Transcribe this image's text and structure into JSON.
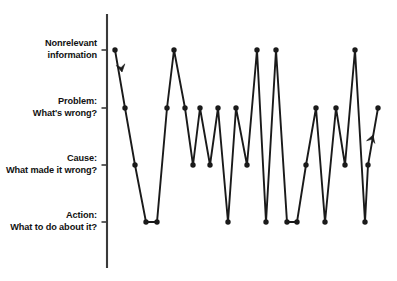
{
  "figure": {
    "background_color": "#ffffff",
    "line_color": "#1a1a1a",
    "marker_color": "#1a1a1a",
    "axis_color": "#3a3a3a"
  },
  "axis": {
    "name": "information-type-axis",
    "orientation": "vertical",
    "x_position": 107,
    "top": 14,
    "bottom": 268,
    "ticks": [
      {
        "id": "nonrelevant",
        "y": 50,
        "line1": "Nonrelevant",
        "line2": "information",
        "value": 4
      },
      {
        "id": "problem",
        "y": 108,
        "line1": "Problem:",
        "line2": "What's wrong?",
        "value": 3
      },
      {
        "id": "cause",
        "y": 165,
        "line1": "Cause:",
        "line2": "What made it wrong?",
        "value": 2
      },
      {
        "id": "action",
        "y": 222,
        "line1": "Action:",
        "line2": "What to do about it?",
        "value": 1
      }
    ]
  },
  "annotations": [
    {
      "id": "start-arrow",
      "name": "down-arrow-marker",
      "direction": "down",
      "x": 122,
      "y": 72,
      "angle": 79
    },
    {
      "id": "end-arrow",
      "name": "up-arrow-marker",
      "direction": "up",
      "x": 373,
      "y": 135,
      "angle": -72
    }
  ],
  "chart_data": {
    "type": "line",
    "title": "",
    "subtitle": "",
    "xlabel": "",
    "ylabel": "",
    "grid": false,
    "legend": false,
    "legend_position": "none",
    "x_axis_visible": false,
    "ylim": [
      1,
      4
    ],
    "y_tick_labels": [
      "Action: What to do about it?",
      "Cause: What made it wrong?",
      "Problem: What's wrong?",
      "Nonrelevant information"
    ],
    "y_tick_values": [
      1,
      2,
      3,
      4
    ],
    "marker": "circle",
    "series": [
      {
        "name": "utterance-sequence",
        "x": [
          115,
          125,
          135,
          146,
          157,
          167,
          174,
          185,
          193,
          200,
          210,
          218,
          228,
          236,
          247,
          257,
          266,
          276,
          287,
          297,
          306,
          316,
          325,
          336,
          345,
          355,
          365,
          368,
          378
        ],
        "values": [
          4,
          3,
          2,
          1,
          1,
          3,
          4,
          3,
          2,
          3,
          2,
          3,
          1,
          3,
          2,
          4,
          1,
          4,
          1,
          1,
          2,
          3,
          1,
          3,
          2,
          4,
          1,
          2,
          3
        ],
        "categories": [
          "Nonrelevant information",
          "Problem: What's wrong?",
          "Cause: What made it wrong?",
          "Action: What to do about it?",
          "Action: What to do about it?",
          "Problem: What's wrong?",
          "Nonrelevant information",
          "Problem: What's wrong?",
          "Cause: What made it wrong?",
          "Problem: What's wrong?",
          "Cause: What made it wrong?",
          "Problem: What's wrong?",
          "Action: What to do about it?",
          "Problem: What's wrong?",
          "Cause: What made it wrong?",
          "Nonrelevant information",
          "Action: What to do about it?",
          "Nonrelevant information",
          "Action: What to do about it?",
          "Action: What to do about it?",
          "Cause: What made it wrong?",
          "Problem: What's wrong?",
          "Action: What to do about it?",
          "Problem: What's wrong?",
          "Cause: What made it wrong?",
          "Nonrelevant information",
          "Action: What to do about it?",
          "Cause: What made it wrong?",
          "Problem: What's wrong?"
        ]
      }
    ]
  }
}
